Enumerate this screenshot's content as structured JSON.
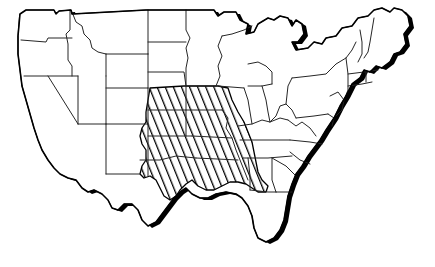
{
  "figure": {
    "type": "map",
    "style": "black and white line art with drop-shadow relief",
    "width": 435,
    "height": 267
  },
  "colors": {
    "background": "#ffffff",
    "land_fill": "#ffffff",
    "outline": "#000000",
    "state_border": "#262626",
    "shadow": "#000000",
    "hatch": "#000000"
  },
  "legend": {
    "highlight_label": "",
    "highlight_pattern": "diagonal-hatch"
  },
  "map_data": {
    "projection": "simplified",
    "shadow_edges": [
      "pacific-coast",
      "gulf-coast",
      "atlantic-coast",
      "great-lakes",
      "northeast"
    ],
    "highlighted_region": {
      "name": "Central Plains",
      "pattern": "diagonal hatch lines, lower-left to upper-right",
      "hatch_spacing_px": 6,
      "hatch_angle_deg": 22,
      "states": [
        "Iowa",
        "Nebraska",
        "Missouri",
        "Kansas",
        "Oklahoma",
        "Arkansas",
        "Texas",
        "Louisiana"
      ]
    },
    "unhighlighted_states": [
      "Washington",
      "Oregon",
      "California",
      "Nevada",
      "Idaho",
      "Montana",
      "Wyoming",
      "Utah",
      "Arizona",
      "Colorado",
      "New Mexico",
      "North Dakota",
      "South Dakota",
      "Minnesota",
      "Wisconsin",
      "Michigan",
      "Illinois",
      "Indiana",
      "Ohio",
      "Kentucky",
      "Tennessee",
      "Mississippi",
      "Alabama",
      "Georgia",
      "Florida",
      "South Carolina",
      "North Carolina",
      "Virginia",
      "West Virginia",
      "Maryland",
      "Delaware",
      "Pennsylvania",
      "New Jersey",
      "New York",
      "Connecticut",
      "Rhode Island",
      "Massachusetts",
      "Vermont",
      "New Hampshire",
      "Maine"
    ]
  }
}
